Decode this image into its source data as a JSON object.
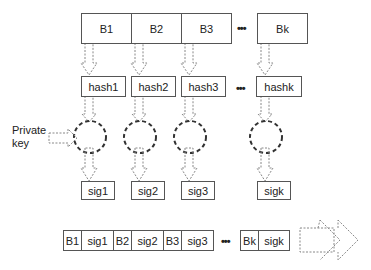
{
  "diagram": {
    "type": "hash-then-sign block signing scheme",
    "blocks": [
      "B1",
      "B2",
      "B3",
      "Bk"
    ],
    "hashes": [
      "hash1",
      "hash2",
      "hash3",
      "hashk"
    ],
    "signatures": [
      "sig1",
      "sig2",
      "sig3",
      "sigk"
    ],
    "ellipsis": "•••",
    "private_key_label": "Private key",
    "output_stream": [
      {
        "block": "B1",
        "sig": "sig1"
      },
      {
        "block": "B2",
        "sig": "sig2"
      },
      {
        "block": "B3",
        "sig": "sig3"
      },
      {
        "block": "Bk",
        "sig": "sigk"
      }
    ],
    "colors": {
      "stroke": "#555555",
      "dashed_arrow": "#777777",
      "circle": "#333333",
      "background": "#ffffff"
    }
  }
}
